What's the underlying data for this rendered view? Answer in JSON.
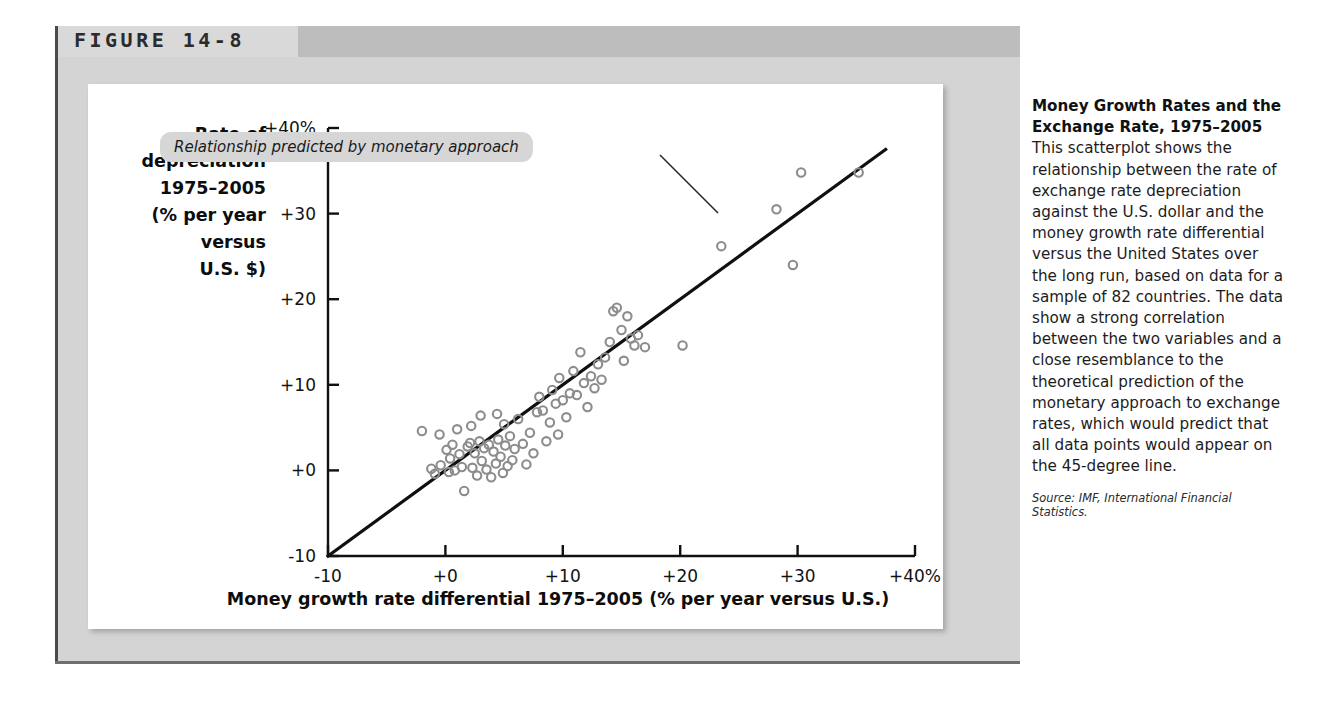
{
  "figure": {
    "label": "FIGURE 14-8",
    "header_band_color": "#d9d9d9",
    "header_accent_color": "#bdbdbd",
    "panel_color": "#d4d4d4",
    "card_color": "#ffffff"
  },
  "caption": {
    "lead": "Money Growth Rates and the Exchange Rate, 1975–2005",
    "body": " This scatterplot shows the relationship between the rate of exchange rate depreciation against the U.S. dollar and the money growth rate differential versus the United States over the long run, based on data for a sample of 82 countries. The data show a strong correlation between the two variables and a close resemblance to the theoretical prediction of the monetary approach to exchange rates, which would predict that all data points would appear on the 45-degree line.",
    "source": "Source: IMF, International Financial Statistics."
  },
  "annotation": {
    "text": "Relationship predicted by monetary approach",
    "pill_color": "#d6d6d6",
    "leader_from": [
      660,
      155
    ],
    "leader_to": [
      718,
      213
    ]
  },
  "chart_data": {
    "type": "scatter",
    "title": "",
    "xlabel": "Money growth rate differential 1975–2005 (% per year versus U.S.)",
    "ylabel_lines": [
      "Rate of",
      "depreciation",
      "1975–2005",
      "(% per year",
      "versus",
      "U.S. $)"
    ],
    "xlim": [
      -10,
      40
    ],
    "ylim": [
      -10,
      40
    ],
    "xticks": [
      -10,
      0,
      10,
      20,
      30,
      40
    ],
    "xticklabels": [
      "-10",
      "+0",
      "+10",
      "+20",
      "+30",
      "+40%"
    ],
    "yticks": [
      -10,
      0,
      10,
      20,
      30,
      40
    ],
    "yticklabels": [
      "-10",
      "+0",
      "+10",
      "+20",
      "+30",
      "+40%"
    ],
    "grid": false,
    "legend": "none",
    "marker": "open-circle",
    "marker_color": "#8c8c8c",
    "reference_line": {
      "label": "45-degree line",
      "from": [
        -10,
        -10
      ],
      "to": [
        37.5,
        37.5
      ],
      "color": "#101010"
    },
    "n_points": 82,
    "points": [
      [
        -2.0,
        4.6
      ],
      [
        -1.2,
        0.2
      ],
      [
        -0.9,
        -0.4
      ],
      [
        -0.5,
        4.2
      ],
      [
        -0.4,
        0.6
      ],
      [
        0.1,
        2.4
      ],
      [
        0.3,
        -0.2
      ],
      [
        0.4,
        1.4
      ],
      [
        0.6,
        3.0
      ],
      [
        0.8,
        0.0
      ],
      [
        1.0,
        4.8
      ],
      [
        1.2,
        1.9
      ],
      [
        1.4,
        0.4
      ],
      [
        1.6,
        -2.4
      ],
      [
        1.9,
        2.8
      ],
      [
        2.1,
        3.2
      ],
      [
        2.3,
        0.3
      ],
      [
        2.5,
        2.0
      ],
      [
        2.7,
        -0.6
      ],
      [
        2.9,
        3.4
      ],
      [
        3.1,
        1.1
      ],
      [
        3.3,
        2.6
      ],
      [
        3.5,
        0.1
      ],
      [
        3.7,
        3.0
      ],
      [
        3.9,
        -0.8
      ],
      [
        4.1,
        2.2
      ],
      [
        4.3,
        0.8
      ],
      [
        4.5,
        3.6
      ],
      [
        4.7,
        1.6
      ],
      [
        4.9,
        -0.3
      ],
      [
        5.1,
        2.9
      ],
      [
        5.3,
        0.5
      ],
      [
        5.5,
        4.0
      ],
      [
        5.7,
        1.2
      ],
      [
        5.9,
        2.5
      ],
      [
        3.0,
        6.4
      ],
      [
        4.4,
        6.6
      ],
      [
        2.2,
        5.2
      ],
      [
        5.0,
        5.4
      ],
      [
        6.2,
        6.0
      ],
      [
        6.6,
        3.1
      ],
      [
        6.9,
        0.7
      ],
      [
        7.2,
        4.4
      ],
      [
        7.5,
        2.0
      ],
      [
        7.8,
        6.8
      ],
      [
        8.0,
        8.6
      ],
      [
        8.3,
        7.0
      ],
      [
        8.6,
        3.4
      ],
      [
        8.9,
        5.6
      ],
      [
        9.1,
        9.4
      ],
      [
        9.4,
        7.8
      ],
      [
        9.7,
        10.8
      ],
      [
        10.0,
        8.2
      ],
      [
        10.3,
        6.2
      ],
      [
        10.6,
        9.0
      ],
      [
        10.9,
        11.6
      ],
      [
        11.2,
        8.8
      ],
      [
        11.5,
        13.8
      ],
      [
        11.8,
        10.2
      ],
      [
        12.1,
        7.4
      ],
      [
        12.4,
        11.0
      ],
      [
        12.7,
        9.6
      ],
      [
        13.0,
        12.4
      ],
      [
        13.3,
        10.6
      ],
      [
        13.6,
        13.2
      ],
      [
        14.0,
        15.0
      ],
      [
        14.3,
        18.6
      ],
      [
        14.6,
        19.0
      ],
      [
        15.0,
        16.4
      ],
      [
        15.2,
        12.8
      ],
      [
        15.5,
        18.0
      ],
      [
        15.8,
        15.4
      ],
      [
        16.1,
        14.6
      ],
      [
        16.4,
        15.8
      ],
      [
        17.0,
        14.4
      ],
      [
        9.6,
        4.2
      ],
      [
        20.2,
        14.6
      ],
      [
        23.5,
        26.2
      ],
      [
        28.2,
        30.5
      ],
      [
        29.6,
        24.0
      ],
      [
        30.3,
        34.8
      ],
      [
        35.2,
        34.8
      ]
    ]
  }
}
